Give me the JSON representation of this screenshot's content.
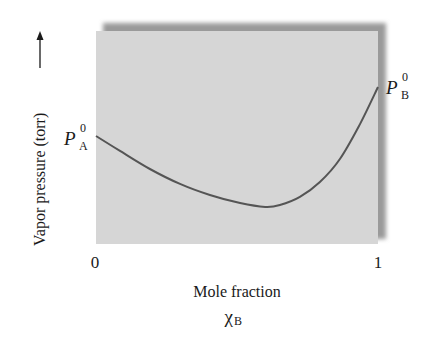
{
  "chart_data": {
    "type": "line",
    "title": "",
    "xlabel": "Mole fraction",
    "xlabel_symbol": "χ",
    "xlabel_subscript": "B",
    "ylabel": "Vapor pressure (torr)",
    "ylabel_arrow": "⟶",
    "x_ticks": [
      {
        "value": 0,
        "label": "0"
      },
      {
        "value": 1,
        "label": "1"
      }
    ],
    "xlim": [
      0,
      1
    ],
    "ylim": [
      0,
      100
    ],
    "grid": false,
    "legend": null,
    "annotations": [
      {
        "id": "pa0",
        "base": "P",
        "sub": "A",
        "sup": "0",
        "x": 0,
        "y": 50.7
      },
      {
        "id": "pb0",
        "base": "P",
        "sub": "B",
        "sup": "0",
        "x": 1,
        "y": 73.7
      }
    ],
    "series": [
      {
        "name": "Vapor pressure",
        "color": "#555555",
        "x": [
          0,
          0.085,
          0.191,
          0.298,
          0.404,
          0.511,
          0.6,
          0.652,
          0.723,
          0.794,
          0.865,
          0.936,
          1.0
        ],
        "values": [
          50.7,
          43.7,
          35.2,
          28.2,
          23.0,
          19.2,
          17.4,
          18.3,
          22.1,
          29.1,
          39.9,
          56.3,
          73.7
        ]
      }
    ],
    "colors": {
      "plot_fill": "#d6d6d6",
      "shadow": "#9a9a9a",
      "curve": "#555555",
      "text": "#1a1a1a"
    }
  }
}
